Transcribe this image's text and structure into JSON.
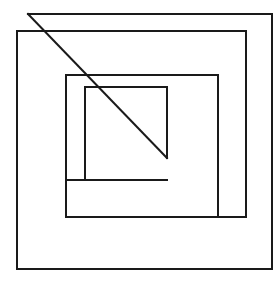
{
  "figure": {
    "background_color": "#ffffff",
    "stroke_color": "#1a1a1a",
    "stroke_width": 2,
    "canvas": {
      "width": 278,
      "height": 282
    },
    "shapes": [
      {
        "name": "outer-square",
        "type": "polyline",
        "closed": false,
        "label": "Outermost square",
        "points": "28,14 272,14 272,269 17,269 17,31 246,31"
      },
      {
        "name": "second-square",
        "type": "polyline",
        "closed": false,
        "label": "Second square",
        "points": "246,31 246,217 66,217 66,75 218,75 218,217"
      },
      {
        "name": "third-square",
        "type": "polyline",
        "closed": false,
        "label": "Third square",
        "points": "66,75 66,180 85,180 85,87 167,87 167,158"
      },
      {
        "name": "inner-square",
        "type": "polyline",
        "closed": false,
        "label": "Innermost square",
        "points": "85,87 167,87 167,158"
      },
      {
        "name": "inner-square-bottom",
        "type": "polyline",
        "closed": false,
        "label": "Innermost square bottom and left",
        "points": "167,180 85,180 85,87"
      },
      {
        "name": "diagonal-line",
        "type": "line",
        "closed": false,
        "label": "Diagonal line",
        "points": "28,14 167,158"
      }
    ]
  }
}
